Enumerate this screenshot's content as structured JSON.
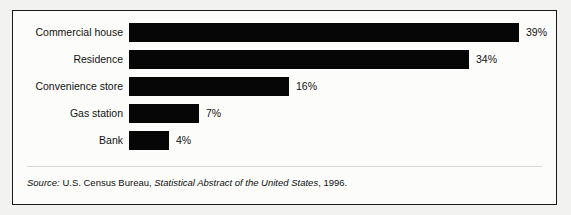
{
  "chart_data": {
    "type": "bar",
    "orientation": "horizontal",
    "title": "",
    "subtitle": "",
    "xlabel": "",
    "ylabel": "",
    "categories": [
      "Commercial house",
      "Residence",
      "Convenience store",
      "Gas station",
      "Bank"
    ],
    "values": [
      39,
      34,
      16,
      7,
      4
    ],
    "value_labels": [
      "39%",
      "34%",
      "16%",
      "7%",
      "4%"
    ],
    "unit": "%",
    "xlim": [
      0,
      39
    ],
    "grid": false,
    "legend": null,
    "bar_color": "#060606",
    "annotations": [
      "Source: U.S. Census Bureau, Statistical Abstract of the United States, 1996."
    ]
  },
  "figure": {
    "border_color": "#1a1a1a",
    "background_color": "#fcfcfb"
  },
  "bars": [
    {
      "label": "Commercial house",
      "value": 39,
      "value_label": "39%"
    },
    {
      "label": "Residence",
      "value": 34,
      "value_label": "34%"
    },
    {
      "label": "Convenience store",
      "value": 16,
      "value_label": "16%"
    },
    {
      "label": "Gas station",
      "value": 7,
      "value_label": "7%"
    },
    {
      "label": "Bank",
      "value": 4,
      "value_label": "4%"
    }
  ],
  "source": {
    "prefix": "Source:",
    "publisher": " U.S. Census Bureau, ",
    "publication": "Statistical Abstract of the United States",
    "suffix": ", 1996."
  }
}
